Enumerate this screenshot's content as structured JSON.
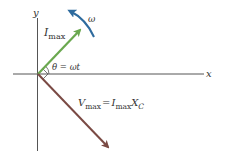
{
  "diagram": {
    "type": "phasor-diagram",
    "axes": {
      "x_label": "x",
      "y_label": "y"
    },
    "current_phasor": {
      "symbol": "I",
      "subscript": "max",
      "color": "#6aa84f"
    },
    "voltage_phasor": {
      "lhs_symbol": "V",
      "lhs_subscript": "max",
      "equals": "=",
      "rhs_symbol1": "I",
      "rhs_subscript1": "max",
      "rhs_symbol2": "X",
      "rhs_subscript2": "C",
      "color": "#7a4a44"
    },
    "angle_label": "θ = ωt",
    "rotation": {
      "symbol": "ω",
      "color": "#2e6b9e"
    },
    "right_angle_marker": true
  }
}
